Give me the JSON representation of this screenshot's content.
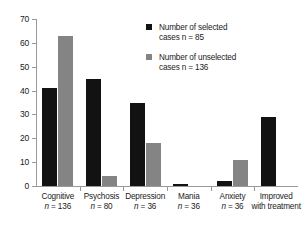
{
  "chart_data": {
    "type": "bar",
    "title": "",
    "subtitle": "",
    "xlabel": "",
    "ylabel": "",
    "ylim": [
      0,
      70
    ],
    "yticks": [
      0,
      10,
      20,
      30,
      40,
      50,
      60,
      70
    ],
    "grid": false,
    "legend_position": "top-right",
    "categories": [
      "Cognitive",
      "Psychosis",
      "Depression",
      "Mania",
      "Anxiety",
      "Improved with treatment"
    ],
    "category_labels": [
      {
        "name": "Cognitive",
        "sub": "n = 136"
      },
      {
        "name": "Psychosis",
        "sub": "n = 80"
      },
      {
        "name": "Depression",
        "sub": "n = 36"
      },
      {
        "name": "Mania",
        "sub": "n = 36"
      },
      {
        "name": "Anxiety",
        "sub": "n = 36"
      },
      {
        "name": "Improved",
        "sub": "with treatment"
      }
    ],
    "series": [
      {
        "name": "Number of selected cases n = 85",
        "color": "#121212",
        "values": [
          41,
          45,
          35,
          1,
          2,
          29
        ]
      },
      {
        "name": "Number of unselected cases n = 136",
        "color": "#848484",
        "values": [
          63,
          4,
          18,
          0,
          11,
          0
        ]
      }
    ]
  },
  "legend": {
    "items": [
      {
        "swatch": "#121212",
        "line1": "Number of selected",
        "line2": "cases n = 85"
      },
      {
        "swatch": "#848484",
        "line1": "Number of unselected",
        "line2": "cases n = 136"
      }
    ]
  },
  "axis": {
    "y_tick_labels": [
      "70",
      "60",
      "50",
      "40",
      "30",
      "20",
      "10",
      "0"
    ]
  }
}
